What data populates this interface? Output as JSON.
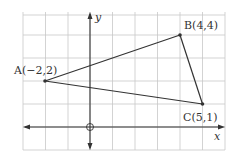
{
  "diagram": {
    "type": "coordinate-plane-triangle",
    "axes": {
      "x_label": "x",
      "y_label": "y",
      "origin_marker": "circle"
    },
    "grid": {
      "x_min": -3,
      "x_max": 6,
      "y_min": -1,
      "y_max": 5,
      "step": 1
    },
    "points": [
      {
        "name": "A",
        "x": -2,
        "y": 2,
        "label": "A(−2,2)"
      },
      {
        "name": "B",
        "x": 4,
        "y": 4,
        "label": "B(4,4)"
      },
      {
        "name": "C",
        "x": 5,
        "y": 1,
        "label": "C(5,1)"
      }
    ],
    "segments": [
      [
        "A",
        "B"
      ],
      [
        "B",
        "C"
      ],
      [
        "C",
        "A"
      ]
    ],
    "colors": {
      "grid": "#c8c8c8",
      "line": "#333333",
      "axis": "#333333"
    }
  }
}
